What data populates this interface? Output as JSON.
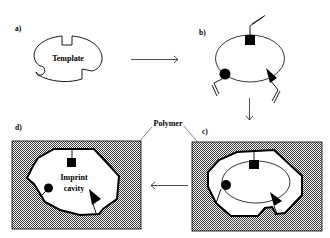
{
  "panels": {
    "a": {
      "label": "a)",
      "title": "Template"
    },
    "b": {
      "label": "b)"
    },
    "c": {
      "label": "c)"
    },
    "d": {
      "label": "d)",
      "cavity_line1": "Imprint",
      "cavity_line2": "cavity"
    }
  },
  "callouts": {
    "polymer": "Polymer"
  },
  "colors": {
    "line": "#000000",
    "background": "#ffffff",
    "polymer_dots": "#555555"
  },
  "arrows": [
    {
      "from": "a",
      "to": "b",
      "direction": "right"
    },
    {
      "from": "b",
      "to": "c",
      "direction": "down"
    },
    {
      "from": "c",
      "to": "d",
      "direction": "left"
    }
  ]
}
